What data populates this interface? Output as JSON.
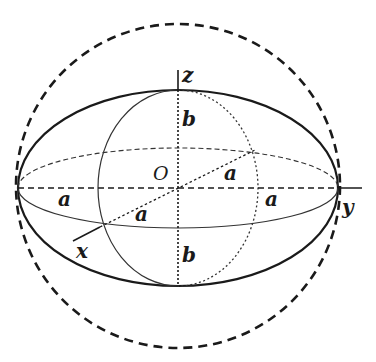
{
  "diagram": {
    "type": "spheroid-with-circumscribed-sphere",
    "labels": {
      "z_axis": "z",
      "y_axis": "y",
      "x_axis": "x",
      "origin": "O",
      "semi_axis_b_top": "b",
      "semi_axis_b_bottom": "b",
      "semi_axis_a_left": "a",
      "semi_axis_a_right": "a",
      "semi_axis_a_diag_upper": "a",
      "semi_axis_a_diag_lower": "a"
    },
    "shapes": [
      {
        "name": "circumscribed-sphere-outline",
        "style": "dashed-bold"
      },
      {
        "name": "spheroid-outline",
        "style": "solid-bold"
      },
      {
        "name": "equatorial-ellipse",
        "style": "front-solid-thin, back-dashed"
      },
      {
        "name": "meridian-ellipse",
        "style": "front-solid-thin, back-dotted"
      },
      {
        "name": "axes",
        "style": "dashed-inside, solid-outside"
      }
    ],
    "colors": {
      "stroke": "#1a1a1a",
      "background": "#ffffff"
    }
  }
}
